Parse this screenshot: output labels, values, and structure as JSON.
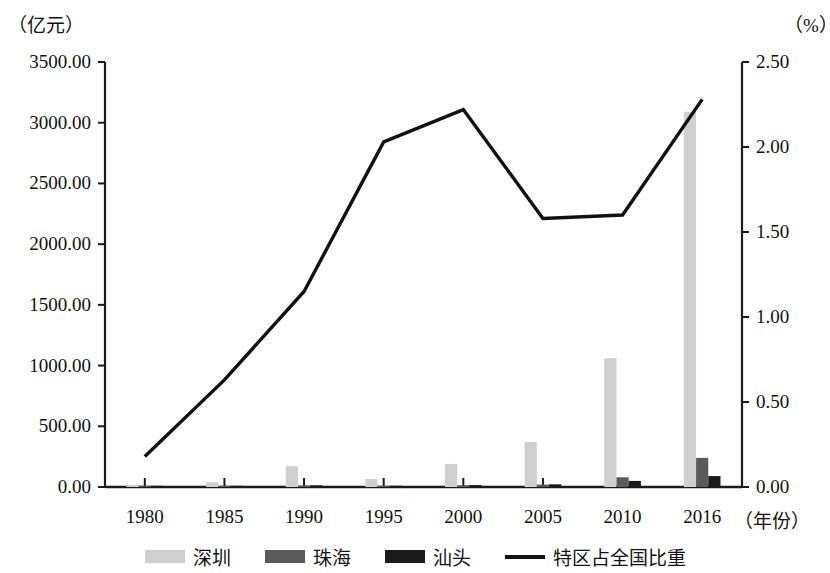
{
  "chart_data": {
    "type": "bar",
    "title": "",
    "subtitle": "",
    "categories": [
      "1980",
      "1985",
      "1990",
      "1995",
      "2000",
      "2005",
      "2010",
      "2016"
    ],
    "xlabel": "（年份）",
    "ylabel_left": "（亿元）",
    "ylabel_right": "（%）",
    "ylim_left": [
      0,
      3500
    ],
    "ylim_right": [
      0,
      2.5
    ],
    "yticks_left": [
      "0.00",
      "500.00",
      "1000.00",
      "1500.00",
      "2000.00",
      "2500.00",
      "3000.00",
      "3500.00"
    ],
    "yticks_right": [
      "0.00",
      "0.50",
      "1.00",
      "1.50",
      "2.00",
      "2.50"
    ],
    "ytick_values_left": [
      0,
      500,
      1000,
      1500,
      2000,
      2500,
      3000,
      3500
    ],
    "ytick_values_right": [
      0,
      0.5,
      1.0,
      1.5,
      2.0,
      2.5
    ],
    "grid": false,
    "legend_position": "bottom",
    "series": [
      {
        "name": "深圳",
        "kind": "bar",
        "axis": "left",
        "color": "#cfcfcf",
        "values": [
          2.7,
          39,
          171.5,
          65,
          190,
          370,
          1060,
          3090
        ]
      },
      {
        "name": "珠海",
        "kind": "bar",
        "axis": "left",
        "color": "#5a5a5a",
        "values": [
          0.9,
          4.5,
          12,
          8,
          14,
          20,
          80,
          240
        ]
      },
      {
        "name": "汕头",
        "kind": "bar",
        "axis": "left",
        "color": "#1a1a1a",
        "values": [
          1.2,
          5.5,
          14,
          10,
          16,
          22,
          50,
          90
        ]
      },
      {
        "name": "特区占全国比重",
        "kind": "line",
        "axis": "right",
        "color": "#111111",
        "values": [
          0.18,
          0.63,
          1.15,
          2.03,
          2.22,
          1.58,
          1.6,
          2.28
        ]
      }
    ]
  },
  "legend": {
    "items": [
      {
        "label": "深圳",
        "swatch": "bar",
        "color": "#cfcfcf"
      },
      {
        "label": "珠海",
        "swatch": "bar",
        "color": "#5a5a5a"
      },
      {
        "label": "汕头",
        "swatch": "bar",
        "color": "#1a1a1a"
      },
      {
        "label": "特区占全国比重",
        "swatch": "line",
        "color": "#111111"
      }
    ]
  }
}
